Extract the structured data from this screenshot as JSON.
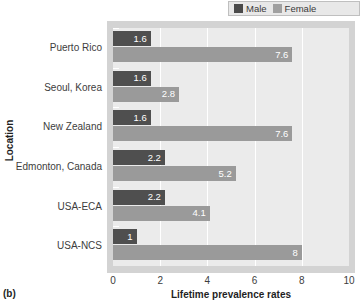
{
  "figure": {
    "panel_label": "(b)",
    "colors": {
      "male": "#4f4f4f",
      "female": "#9a9a9a",
      "plot_background": "#ebebeb",
      "plot_border": "#d3d3d3",
      "gridline": "#ffffff",
      "legend_background": "#e8e8e8",
      "value_label": "#ffffff"
    }
  },
  "legend": {
    "position": "top-right",
    "entries": [
      {
        "label": "Male",
        "swatch_icon": "square-swatch-dark"
      },
      {
        "label": "Female",
        "swatch_icon": "square-swatch-light"
      }
    ]
  },
  "chart_data": {
    "type": "bar",
    "orientation": "horizontal",
    "title": "",
    "subtitle": "",
    "xlabel": "Lifetime prevalence rates",
    "ylabel": "Location",
    "xlim": [
      0,
      10
    ],
    "xticks": [
      "0",
      "2",
      "4",
      "6",
      "8",
      "10"
    ],
    "grid": "vertical",
    "legend_position": "top-right",
    "categories": [
      "Puerto Rico",
      "Seoul, Korea",
      "New Zealand",
      "Edmonton, Canada",
      "USA-ECA",
      "USA-NCS"
    ],
    "series": [
      {
        "name": "Male",
        "color": "#4f4f4f",
        "values": [
          1.6,
          1.6,
          1.6,
          2.2,
          2.2,
          1
        ],
        "labels": [
          "1.6",
          "1.6",
          "1.6",
          "2.2",
          "2.2",
          "1"
        ]
      },
      {
        "name": "Female",
        "color": "#9a9a9a",
        "values": [
          7.6,
          2.8,
          7.6,
          5.2,
          4.1,
          8
        ],
        "labels": [
          "7.6",
          "2.8",
          "7.6",
          "5.2",
          "4.1",
          "8"
        ]
      }
    ]
  }
}
